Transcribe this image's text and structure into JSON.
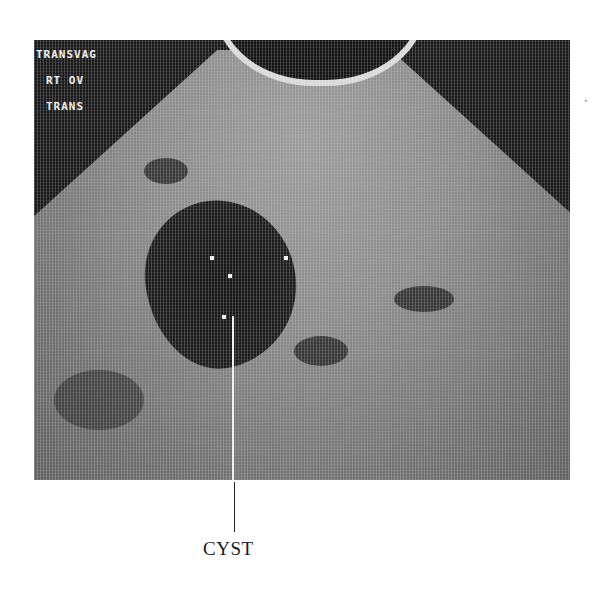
{
  "figure": {
    "type": "ultrasound-scan",
    "overlay_text": [
      "TRANSVAG",
      "RT OV",
      "TRANS"
    ],
    "annotation_label": "CYST",
    "stray_mark": "`"
  }
}
